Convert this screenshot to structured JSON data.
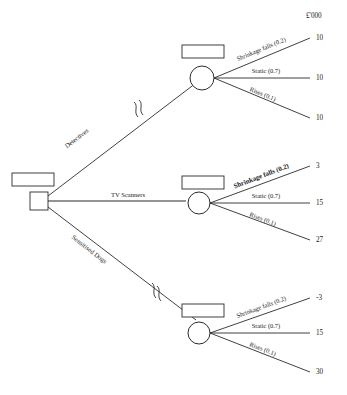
{
  "diagram": {
    "type": "decision-tree",
    "unit_label": "£'000",
    "root": {
      "name": "root-decision-node",
      "shape": "square",
      "value_label": "13,800"
    },
    "branches": [
      {
        "id": "detectives",
        "label": "Detectives",
        "node_value_label": "10,000",
        "node_shape": "circle",
        "has_break_mark": true,
        "outcomes": [
          {
            "label": "Shrinkage falls (0.2)",
            "probability": 0.2,
            "payoff": "10",
            "emphasis": "normal"
          },
          {
            "label": "Static (0.7)",
            "probability": 0.7,
            "payoff": "10",
            "emphasis": "normal"
          },
          {
            "label": "Rises (0.1)",
            "probability": 0.1,
            "payoff": "10",
            "emphasis": "normal"
          }
        ]
      },
      {
        "id": "tv-scanners",
        "label": "TV Scanners",
        "node_value_label": "13,800",
        "node_shape": "circle",
        "has_break_mark": false,
        "outcomes": [
          {
            "label": "Shrinkage falls (0.2)",
            "probability": 0.2,
            "payoff": "3",
            "emphasis": "bold"
          },
          {
            "label": "Static (0.7)",
            "probability": 0.7,
            "payoff": "15",
            "emphasis": "normal"
          },
          {
            "label": "Rises (0.1)",
            "probability": 0.1,
            "payoff": "27",
            "emphasis": "normal"
          }
        ]
      },
      {
        "id": "sensitised-dogs",
        "label": "Sensitised Dogs",
        "node_value_label": "12,900",
        "node_shape": "circle",
        "has_break_mark": true,
        "outcomes": [
          {
            "label": "Shrinkage falls (0.2)",
            "probability": 0.2,
            "payoff": "-3",
            "emphasis": "normal"
          },
          {
            "label": "Static (0.7)",
            "probability": 0.7,
            "payoff": "15",
            "emphasis": "normal"
          },
          {
            "label": "Rises (0.1)",
            "probability": 0.1,
            "payoff": "30",
            "emphasis": "normal"
          }
        ]
      }
    ],
    "colors": {
      "ink": "#1a1a1a",
      "stroke": "#2b2b2b",
      "background": "#ffffff"
    }
  }
}
